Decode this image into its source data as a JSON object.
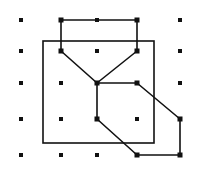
{
  "diagram": {
    "type": "dot-grid-figure",
    "colors": {
      "background": "#ffffff",
      "ink": "#111111"
    },
    "grid": {
      "columns_x": [
        21,
        61,
        97,
        137,
        180
      ],
      "rows_y": [
        20,
        51,
        83,
        119,
        155
      ],
      "dot_size": 4
    },
    "square": {
      "x": 43,
      "y": 41,
      "width": 111,
      "height": 102
    },
    "shape_vertices": [
      [
        61,
        20
      ],
      [
        137,
        20
      ],
      [
        137,
        51
      ],
      [
        97,
        83
      ],
      [
        61,
        51
      ],
      [
        61,
        20
      ]
    ],
    "shape_vertices_2": [
      [
        97,
        83
      ],
      [
        137,
        83
      ],
      [
        180,
        119
      ],
      [
        180,
        155
      ],
      [
        137,
        155
      ],
      [
        97,
        119
      ],
      [
        97,
        83
      ]
    ],
    "vertex_markers": [
      [
        61,
        20
      ],
      [
        137,
        20
      ],
      [
        61,
        51
      ],
      [
        137,
        51
      ],
      [
        97,
        83
      ],
      [
        137,
        83
      ],
      [
        97,
        119
      ],
      [
        180,
        119
      ],
      [
        137,
        155
      ],
      [
        180,
        155
      ]
    ]
  }
}
